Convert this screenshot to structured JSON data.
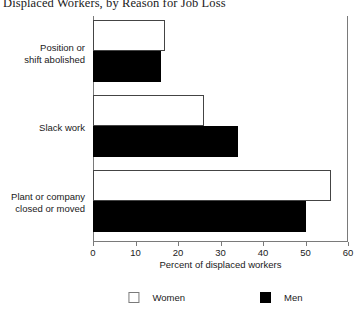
{
  "chart_data": {
    "type": "bar",
    "orientation": "horizontal",
    "title": "Displaced Workers, by Reason for Job Loss",
    "xlabel": "Percent of displaced workers",
    "ylabel": "",
    "xlim": [
      0,
      60
    ],
    "xticks": [
      0,
      10,
      20,
      30,
      40,
      50,
      60
    ],
    "xtick_labels": [
      "0",
      "10",
      "20",
      "30",
      "40",
      "50",
      "60"
    ],
    "grid": false,
    "legend_position": "bottom",
    "categories": [
      "Position or shift abolished",
      "Slack work",
      "Plant or company closed or moved"
    ],
    "category_lines": [
      [
        "Position or",
        "shift abolished"
      ],
      [
        "Slack work"
      ],
      [
        "Plant or company",
        "closed or moved"
      ]
    ],
    "series": [
      {
        "name": "Women",
        "color": "#ffffff",
        "edge_color": "#444444",
        "values": [
          17,
          26,
          56
        ]
      },
      {
        "name": "Men",
        "color": "#000000",
        "edge_color": "#000000",
        "values": [
          16,
          34,
          50
        ]
      }
    ]
  },
  "legend": {
    "entries": [
      {
        "label": "Women",
        "swatch": "hollow-square-swatch"
      },
      {
        "label": "Men",
        "swatch": "filled-square-swatch"
      }
    ]
  }
}
